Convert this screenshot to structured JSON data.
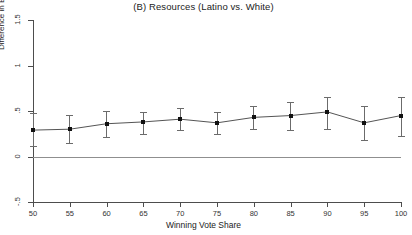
{
  "chart_data": {
    "type": "line",
    "title": "(B) Resources (Latino vs. White)",
    "xlabel": "Winning Vote Share",
    "ylabel": "Difference in Effect of Resources",
    "xlim": [
      50,
      100
    ],
    "ylim": [
      -0.5,
      1.5
    ],
    "grid": false,
    "legend": null,
    "reference_line_y": 0,
    "x_ticks": [
      50,
      55,
      60,
      65,
      70,
      75,
      80,
      85,
      90,
      95,
      100
    ],
    "x_tick_labels": [
      "50",
      "55",
      "60",
      "65",
      "70",
      "75",
      "80",
      "85",
      "90",
      "95",
      "100"
    ],
    "y_ticks": [
      -0.5,
      0,
      0.5,
      1,
      1.5
    ],
    "y_tick_labels": [
      "-.5",
      "0",
      ".5",
      "1",
      "1.5"
    ],
    "x": [
      50,
      55,
      60,
      65,
      70,
      75,
      80,
      85,
      90,
      95,
      100
    ],
    "values": [
      0.29,
      0.3,
      0.36,
      0.38,
      0.41,
      0.37,
      0.43,
      0.45,
      0.49,
      0.37,
      0.45
    ],
    "error_low": [
      0.11,
      0.15,
      0.21,
      0.25,
      0.29,
      0.25,
      0.3,
      0.29,
      0.3,
      0.18,
      0.23
    ],
    "error_high": [
      0.48,
      0.46,
      0.5,
      0.49,
      0.53,
      0.49,
      0.56,
      0.6,
      0.65,
      0.56,
      0.65
    ],
    "series": [
      {
        "name": "Difference in Effect of Resources",
        "values": [
          0.29,
          0.3,
          0.36,
          0.38,
          0.41,
          0.37,
          0.43,
          0.45,
          0.49,
          0.37,
          0.45
        ]
      }
    ]
  },
  "colors": {
    "axis": "#4d4d4d",
    "reference_line": "#8f8f8f",
    "marker": "#111111",
    "error_bar": "#6b6b6b",
    "background": "#ffffff"
  }
}
